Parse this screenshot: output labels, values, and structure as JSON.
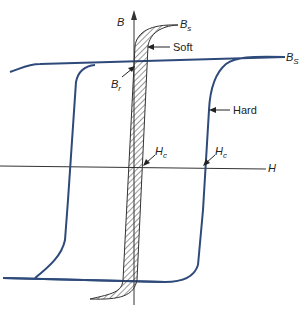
{
  "diagram": {
    "axes": {
      "x_label": "H",
      "y_label": "B"
    },
    "labels": {
      "soft_bs": "B",
      "soft_bs_sub": "s",
      "hard_bs": "B",
      "hard_bs_sub": "S",
      "br": "B",
      "br_sub": "r",
      "hc_soft": "H",
      "hc_soft_sub": "c",
      "hc_hard": "H",
      "hc_hard_sub": "c",
      "soft": "Soft",
      "hard": "Hard"
    },
    "colors": {
      "hard_loop": "#2e4a7a",
      "axes": "#333333",
      "soft_loop": "#333333"
    }
  }
}
